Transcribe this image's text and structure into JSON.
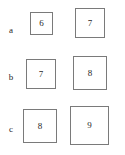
{
  "figure": {
    "background_color": "#ffffff",
    "border_color": "#7a7a7a",
    "text_color": "#1f1f1f",
    "rows": [
      {
        "label": "a",
        "label_x": 5,
        "label_y": 26,
        "cells": [
          {
            "value": "6",
            "x": 30,
            "y": 12,
            "size": 23
          },
          {
            "value": "7",
            "x": 75,
            "y": 8,
            "size": 30
          }
        ]
      },
      {
        "label": "b",
        "label_x": 5,
        "label_y": 73,
        "cells": [
          {
            "value": "7",
            "x": 26,
            "y": 59,
            "size": 30
          },
          {
            "value": "8",
            "x": 73,
            "y": 56,
            "size": 34
          }
        ]
      },
      {
        "label": "c",
        "label_x": 5,
        "label_y": 125,
        "cells": [
          {
            "value": "8",
            "x": 23,
            "y": 109,
            "size": 34
          },
          {
            "value": "9",
            "x": 70,
            "y": 106,
            "size": 39
          }
        ]
      }
    ]
  }
}
